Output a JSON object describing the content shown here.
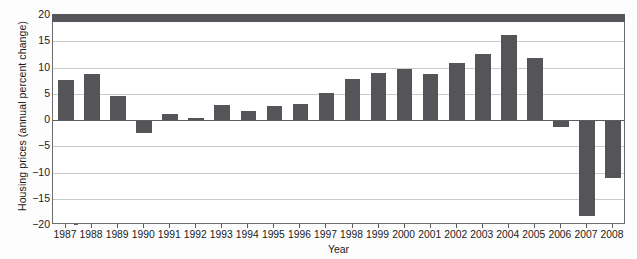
{
  "chart_data": {
    "type": "bar",
    "title": "",
    "xlabel": "Year",
    "ylabel": "Housing prices (annual percent change)",
    "ylim": [
      -20,
      20
    ],
    "yticks": [
      20,
      15,
      10,
      5,
      0,
      -5,
      -10,
      -15,
      -20
    ],
    "ytick_labels": [
      "20",
      "15",
      "10",
      "5",
      "0",
      "−5",
      "−10",
      "−15",
      "−20"
    ],
    "grid": true,
    "legend": "none",
    "bar_color": "#555559",
    "categories": [
      "1987",
      "1988",
      "1989",
      "1990",
      "1991",
      "1992",
      "1993",
      "1994",
      "1995",
      "1996",
      "1997",
      "1998",
      "1999",
      "2000",
      "2001",
      "2002",
      "2003",
      "2004",
      "2005",
      "2006",
      "2007",
      "2008"
    ],
    "values": [
      7.7,
      8.8,
      4.5,
      -2.5,
      1.1,
      0.3,
      2.9,
      1.8,
      2.7,
      3.0,
      5.2,
      7.9,
      9.0,
      9.8,
      8.8,
      10.9,
      12.6,
      16.1,
      11.9,
      -1.4,
      -18.3,
      -11.1
    ],
    "series": [
      {
        "name": "Housing prices",
        "values": [
          7.7,
          8.8,
          4.5,
          -2.5,
          1.1,
          0.3,
          2.9,
          1.8,
          2.7,
          3.0,
          5.2,
          7.9,
          9.0,
          9.8,
          8.8,
          10.9,
          12.6,
          16.1,
          11.9,
          -1.4,
          -18.3,
          -11.1
        ]
      }
    ]
  }
}
